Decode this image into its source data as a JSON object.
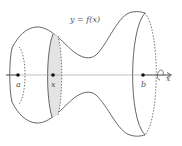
{
  "diagram": {
    "curve_label": "y = f(x)",
    "points": [
      {
        "id": "a",
        "label": "a"
      },
      {
        "id": "x",
        "label": "x"
      },
      {
        "id": "b",
        "label": "b"
      }
    ],
    "axis_label": "x",
    "colors": {
      "stroke": "#666666",
      "slice_fill": "#e4e4e4",
      "axis": "#888888",
      "point": "#111111"
    }
  }
}
